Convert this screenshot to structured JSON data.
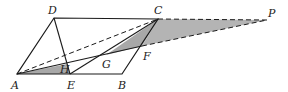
{
  "diagram": {
    "colors": {
      "stroke": "#1a1a1a",
      "shade": "#a8a8a8",
      "background": "#ffffff"
    },
    "points": {
      "A": {
        "label": "A",
        "x": 17,
        "y": 74
      },
      "B": {
        "label": "B",
        "x": 122,
        "y": 74
      },
      "C": {
        "label": "C",
        "x": 158,
        "y": 19
      },
      "D": {
        "label": "D",
        "x": 54,
        "y": 18
      },
      "E": {
        "label": "E",
        "x": 70,
        "y": 74
      },
      "F": {
        "label": "F",
        "x": 142,
        "y": 46
      },
      "G": {
        "label": "G",
        "x": 106,
        "y": 55
      },
      "H": {
        "label": "H",
        "x": 67,
        "y": 64
      },
      "P": {
        "label": "P",
        "x": 267,
        "y": 20
      }
    },
    "labels": {
      "A": "A",
      "B": "B",
      "C": "C",
      "D": "D",
      "E": "E",
      "F": "F",
      "G": "G",
      "H": "H",
      "P": "P"
    }
  }
}
